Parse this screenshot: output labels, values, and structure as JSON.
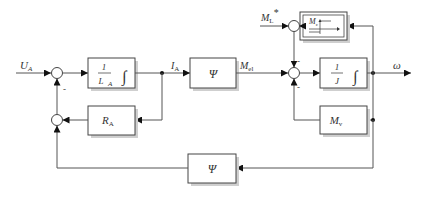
{
  "diagram": {
    "type": "block-diagram",
    "signals": {
      "input_voltage": {
        "main": "U",
        "sub": "A"
      },
      "armature_current": {
        "main": "I",
        "sub": "A"
      },
      "electric_torque": {
        "main": "M",
        "sub": "el"
      },
      "load_torque": {
        "main": "M",
        "sub": "L",
        "sup": "*"
      },
      "output_speed": {
        "main": "ω"
      }
    },
    "blocks": {
      "armature_integrator": {
        "num": "1",
        "den_main": "L",
        "den_sub": "A",
        "op": "∫"
      },
      "armature_resistance": {
        "main": "R",
        "sub": "A"
      },
      "flux_forward": {
        "main": "Ψ"
      },
      "inertia_integrator": {
        "num": "1",
        "den_main": "J",
        "op": "∫"
      },
      "friction": {
        "main": "M",
        "sub": "c"
      },
      "viscous_friction": {
        "main": "M",
        "sub": "v"
      },
      "flux_feedback": {
        "main": "Ψ"
      }
    },
    "signs": {
      "left_sum_feedback": "-",
      "torque_sum_top": "-",
      "torque_sum_bottom": "-"
    }
  }
}
